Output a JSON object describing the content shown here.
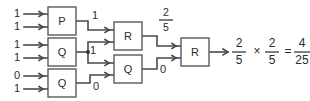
{
  "diagram": {
    "type": "logic-circuit-schematic",
    "colors": {
      "wire": "#4a4a4a",
      "box_stroke": "#5a5a5a",
      "text": "#2b2b2b",
      "background": "#ffffff"
    },
    "gates": [
      {
        "id": "gate-p-1",
        "label": "P",
        "x": 48,
        "y": 7,
        "w": 28,
        "h": 28
      },
      {
        "id": "gate-q-1",
        "label": "Q",
        "x": 48,
        "y": 38,
        "w": 28,
        "h": 28
      },
      {
        "id": "gate-q-2",
        "label": "Q",
        "x": 48,
        "y": 69,
        "w": 28,
        "h": 28
      },
      {
        "id": "gate-r-1",
        "label": "R",
        "x": 114,
        "y": 22,
        "w": 28,
        "h": 28
      },
      {
        "id": "gate-q-3",
        "label": "Q",
        "x": 114,
        "y": 55,
        "w": 28,
        "h": 28
      },
      {
        "id": "gate-r-2",
        "label": "R",
        "x": 181,
        "y": 38,
        "w": 28,
        "h": 28
      }
    ],
    "inputs": [
      {
        "id": "input-p1-a",
        "value": "1",
        "y": 14
      },
      {
        "id": "input-p1-b",
        "value": "1",
        "y": 27
      },
      {
        "id": "input-q1-a",
        "value": "1",
        "y": 45
      },
      {
        "id": "input-q1-b",
        "value": "1",
        "y": 58
      },
      {
        "id": "input-q2-a",
        "value": "0",
        "y": 76
      },
      {
        "id": "input-q2-b",
        "value": "1",
        "y": 89
      }
    ],
    "wire_labels": [
      {
        "id": "label-p1-out",
        "value": "1",
        "x": 95,
        "y": 16
      },
      {
        "id": "label-q1-out",
        "value": "1",
        "x": 93,
        "y": 51
      },
      {
        "id": "label-q2-out",
        "value": "0",
        "x": 96,
        "y": 87
      },
      {
        "id": "label-q3-out",
        "value": "0",
        "x": 163,
        "y": 70
      }
    ],
    "fraction_labels": [
      {
        "id": "label-r1-out",
        "numerator": "2",
        "denominator": "5",
        "x": 166,
        "num_y": 13,
        "bar_y": 20,
        "den_y": 28
      }
    ],
    "equation": {
      "id": "final-equation",
      "text": "2/5 x 2/5 = 4/25",
      "terms": [
        {
          "kind": "fraction",
          "numerator": "2",
          "denominator": "5",
          "x": 239
        },
        {
          "kind": "symbol",
          "text": "×",
          "x": 257
        },
        {
          "kind": "fraction",
          "numerator": "2",
          "denominator": "5",
          "x": 274
        },
        {
          "kind": "symbol",
          "text": "=",
          "x": 288
        },
        {
          "kind": "fraction",
          "numerator": "4",
          "denominator": "25",
          "x": 301
        }
      ],
      "num_y": 45,
      "bar_y": 52,
      "den_y": 61
    }
  }
}
